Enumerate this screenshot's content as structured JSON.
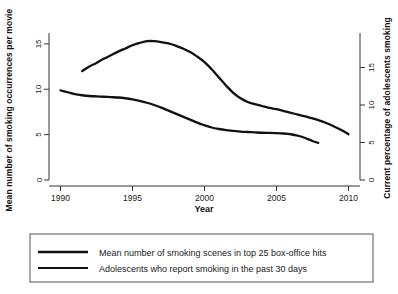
{
  "chart_data": {
    "type": "line",
    "title": "",
    "xlabel": "Year",
    "ylabel": "Mean number of  smoking occurrences per movie",
    "y2label": "Current percentage of adolescents smoking",
    "xlim": [
      1989.2,
      2010.8
    ],
    "ylim": [
      0,
      16.2
    ],
    "y2lim": [
      0,
      19.6
    ],
    "grid": false,
    "legend_position": "bottom",
    "xticks": [
      1990,
      1995,
      2000,
      2005,
      2010
    ],
    "xtick_labels": [
      "1990",
      "1995",
      "2000",
      "2005",
      "2010"
    ],
    "yticks": [
      0,
      5,
      10,
      15
    ],
    "ytick_labels": [
      "0",
      "5",
      "10",
      "15"
    ],
    "y2ticks": [
      0,
      5,
      10,
      15
    ],
    "y2tick_labels": [
      "0",
      "5",
      "10",
      "15"
    ],
    "series": [
      {
        "name": "Mean number of smoking scenes in top 25 box-office hits",
        "axis": "left",
        "stroke_width": 2.3,
        "x": [
          1991.5,
          1992,
          1992.5,
          1993,
          1993.5,
          1994,
          1994.5,
          1995,
          1995.5,
          1996,
          1996.5,
          1997,
          1997.5,
          1998,
          1998.5,
          1999,
          1999.5,
          2000,
          2000.5,
          2001,
          2001.5,
          2002,
          2002.5,
          2003,
          2003.5,
          2004,
          2004.5,
          2005,
          2005.5,
          2006,
          2006.5,
          2007,
          2007.5,
          2008,
          2008.5,
          2009,
          2009.5,
          2010
        ],
        "values": [
          12.0,
          12.5,
          12.9,
          13.35,
          13.75,
          14.15,
          14.5,
          14.85,
          15.1,
          15.3,
          15.3,
          15.2,
          15.05,
          14.8,
          14.5,
          14.1,
          13.6,
          13.0,
          12.2,
          11.3,
          10.4,
          9.6,
          9.0,
          8.6,
          8.35,
          8.15,
          7.95,
          7.8,
          7.6,
          7.4,
          7.2,
          7.0,
          6.8,
          6.55,
          6.25,
          5.9,
          5.5,
          5.05
        ]
      },
      {
        "name": "Adolescents who report smoking in the past 30 days",
        "axis": "right",
        "stroke_width": 2.3,
        "x": [
          1990,
          1990.5,
          1991,
          1991.5,
          1992,
          1992.5,
          1993,
          1993.5,
          1994,
          1994.5,
          1995,
          1995.5,
          1996,
          1996.5,
          1997,
          1997.5,
          1998,
          1998.5,
          1999,
          1999.5,
          2000,
          2000.5,
          2001,
          2001.5,
          2002,
          2002.5,
          2003,
          2003.5,
          2004,
          2004.5,
          2005,
          2005.5,
          2006,
          2006.5,
          2007,
          2007.5,
          2007.9
        ],
        "values": [
          11.95,
          11.7,
          11.45,
          11.3,
          11.2,
          11.15,
          11.1,
          11.05,
          11.0,
          10.9,
          10.75,
          10.55,
          10.3,
          10.0,
          9.65,
          9.25,
          8.85,
          8.45,
          8.05,
          7.65,
          7.3,
          7.0,
          6.8,
          6.65,
          6.55,
          6.45,
          6.4,
          6.35,
          6.3,
          6.28,
          6.25,
          6.2,
          6.1,
          5.9,
          5.6,
          5.2,
          4.95
        ]
      }
    ],
    "legend_entries": [
      {
        "label": "Mean number of smoking scenes in top 25 box-office hits"
      },
      {
        "label": "Adolescents who report smoking in the past 30 days"
      }
    ]
  },
  "colors": {
    "line": "#111111",
    "axis": "#333333",
    "background": "#ffffff",
    "legend_border": "#555555"
  }
}
